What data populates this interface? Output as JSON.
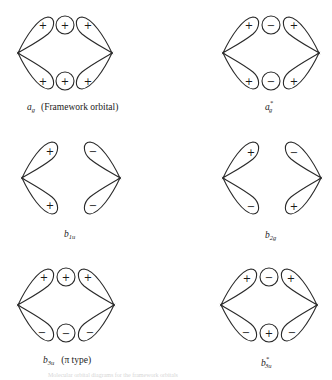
{
  "figure": {
    "panels": [
      {
        "id": "ag",
        "label_main": "a",
        "label_sub": "g",
        "label_sup": "",
        "label_note": "(Framework orbital)",
        "signs": {
          "top_left": "+",
          "top_center": "+",
          "top_right": "+",
          "bottom_left": "+",
          "bottom_center": "+",
          "bottom_right": "+"
        }
      },
      {
        "id": "ag-star",
        "label_main": "a",
        "label_sub": "g",
        "label_sup": "*",
        "label_note": "",
        "signs": {
          "top_left": "+",
          "top_center": "−",
          "top_right": "+",
          "bottom_left": "+",
          "bottom_center": "−",
          "bottom_right": "+"
        }
      },
      {
        "id": "b1u",
        "label_main": "b",
        "label_sub": "1u",
        "label_sup": "",
        "label_note": "",
        "signs": {
          "top_left": "+",
          "top_right": "−",
          "bottom_left": "+",
          "bottom_right": "−"
        }
      },
      {
        "id": "b2g",
        "label_main": "b",
        "label_sub": "2g",
        "label_sup": "",
        "label_note": "",
        "signs": {
          "top_left": "+",
          "top_right": "−",
          "bottom_left": "−",
          "bottom_right": "+"
        }
      },
      {
        "id": "b3u",
        "label_main": "b",
        "label_sub": "3u",
        "label_sup": "",
        "label_note": "(π type)",
        "signs": {
          "top_left": "+",
          "top_center": "+",
          "top_right": "+",
          "bottom_left": "−",
          "bottom_center": "−",
          "bottom_right": "−"
        }
      },
      {
        "id": "b3u-star",
        "label_main": "b",
        "label_sub": "3u",
        "label_sup": "*",
        "label_note": "",
        "signs": {
          "top_left": "+",
          "top_center": "−",
          "top_right": "+",
          "bottom_left": "−",
          "bottom_center": "+",
          "bottom_right": "−"
        }
      }
    ],
    "caption": "Molecular orbital diagrams for the framework orbitals"
  }
}
